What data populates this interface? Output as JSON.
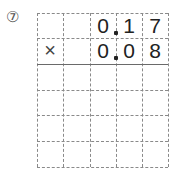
{
  "problem_label": "⑦",
  "grid": {
    "columns": 5,
    "rows": 6
  },
  "row1": [
    "",
    "",
    "0",
    "1",
    "7"
  ],
  "row2": [
    "×",
    "",
    "0",
    "0",
    "8"
  ],
  "decimal_after_column": 3
}
